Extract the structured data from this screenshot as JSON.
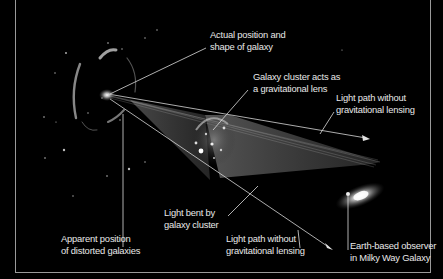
{
  "diagram": {
    "title": "Gravitational lensing",
    "colors": {
      "background": "#000000",
      "frame": "#9a9a9a",
      "label_text": "#e8e8e8",
      "leader_line": "#dcdcdc"
    },
    "labels": {
      "actual_position": {
        "line1": "Actual position and",
        "line2": "shape of galaxy"
      },
      "cluster_lens": {
        "line1": "Galaxy cluster acts as",
        "line2": "a gravitational lens"
      },
      "path_without_upper": {
        "line1": "Light path without",
        "line2": "gravitational lensing"
      },
      "light_bent": {
        "line1": "Light bent by",
        "line2": "galaxy cluster"
      },
      "path_without_lower": {
        "line1": "Light path without",
        "line2": "gravitational lensing"
      },
      "apparent_position": {
        "line1": "Apparent position",
        "line2": "of distorted galaxies"
      },
      "observer": {
        "line1": "Earth-based observer",
        "line2": "in Milky Way Galaxy"
      }
    },
    "objects": [
      "distant-galaxy",
      "distorted-arc-images",
      "galaxy-cluster",
      "milky-way-galaxy",
      "light-beam",
      "straight-light-paths"
    ]
  }
}
